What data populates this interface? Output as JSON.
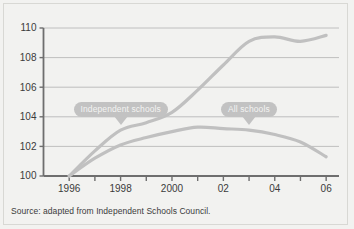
{
  "figure": {
    "source_note": "Source: adapted from Independent Schools Council.",
    "background_color": "#f2f2f0",
    "line_color": "#c0c0c0",
    "axis_color": "#6e6e6e",
    "grid_color": "#b9b9b9",
    "callout_color": "#c2c2c2",
    "callout_text_color": "#f4f4f2"
  },
  "callouts": {
    "independent": "Independent schools",
    "all": "All schools"
  },
  "chart_data": {
    "type": "line",
    "title": "",
    "subtitle": "",
    "xlabel": "",
    "ylabel": "",
    "xlim": [
      1995,
      2006.5
    ],
    "ylim": [
      100,
      110
    ],
    "yticks": [
      100,
      102,
      104,
      106,
      108,
      110
    ],
    "ytick_labels": [
      "100",
      "102",
      "104",
      "106",
      "108",
      "110"
    ],
    "xticks": [
      1996,
      1997,
      1998,
      1999,
      2000,
      2001,
      2002,
      2003,
      2004,
      2005,
      2006
    ],
    "xtick_labels": [
      "1996",
      "",
      "1998",
      "",
      "2000",
      "",
      "02",
      "",
      "04",
      "",
      "06"
    ],
    "grid": "horizontal",
    "legend": "annotations",
    "x": [
      1996,
      1997,
      1998,
      1999,
      2000,
      2001,
      2002,
      2003,
      2004,
      2005,
      2006
    ],
    "series": [
      {
        "name": "Independent schools",
        "values": [
          100.0,
          101.7,
          103.1,
          103.6,
          104.3,
          105.8,
          107.5,
          109.1,
          109.4,
          109.1,
          109.5
        ],
        "annotation_year": 1998,
        "annotation_value": 103.1
      },
      {
        "name": "All schools",
        "values": [
          100.0,
          101.2,
          102.1,
          102.6,
          103.0,
          103.3,
          103.2,
          103.1,
          102.8,
          102.3,
          101.3
        ],
        "annotation_year": 2003,
        "annotation_value": 103.1
      }
    ]
  }
}
